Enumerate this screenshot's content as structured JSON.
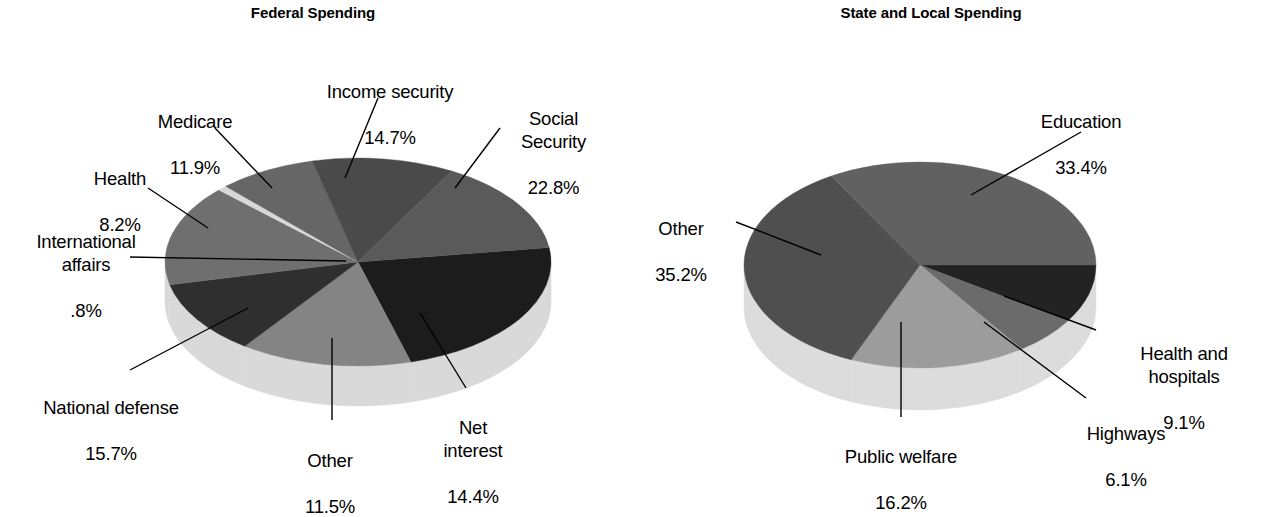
{
  "figure": {
    "background_color": "#ffffff",
    "text_color": "#000000"
  },
  "panels": [
    {
      "id": "federal",
      "title": "Federal Spending"
    },
    {
      "id": "state",
      "title": "State and Local Spending"
    }
  ],
  "federal": {
    "title": "Federal Spending",
    "labels": {
      "income_security": {
        "name": "Income security",
        "value": "14.7%"
      },
      "social_security": {
        "name": "Social\nSecurity",
        "value": "22.8%"
      },
      "net_interest": {
        "name": "Net\ninterest",
        "value": "14.4%"
      },
      "other": {
        "name": "Other",
        "value": "11.5%"
      },
      "national_defense": {
        "name": "National defense",
        "value": "15.7%"
      },
      "international": {
        "name": "International\naffairs",
        "value": ".8%"
      },
      "health": {
        "name": "Health",
        "value": "8.2%"
      },
      "medicare": {
        "name": "Medicare",
        "value": "11.9%"
      }
    }
  },
  "state": {
    "title": "State and Local Spending",
    "labels": {
      "education": {
        "name": "Education",
        "value": "33.4%"
      },
      "health_hospitals": {
        "name": "Health and\nhospitals",
        "value": "9.1%"
      },
      "highways": {
        "name": "Highways",
        "value": "6.1%"
      },
      "public_welfare": {
        "name": "Public welfare",
        "value": "16.2%"
      },
      "other": {
        "name": "Other",
        "value": "35.2%"
      }
    }
  },
  "chart_data": [
    {
      "type": "pie",
      "title": "Federal Spending",
      "id": "federal",
      "unit": "percent",
      "legend": "none",
      "labels_position": "external-with-leader-lines",
      "three_d": true,
      "start_angle_deg": 0,
      "direction": "clockwise",
      "categories": [
        "Social Security",
        "Net interest",
        "Other",
        "National defense",
        "International affairs",
        "Health",
        "Medicare",
        "Income security"
      ],
      "values": [
        22.8,
        14.4,
        11.5,
        15.7,
        0.8,
        8.2,
        11.9,
        14.7
      ],
      "slice_colors": [
        "#1c1c1c",
        "#848484",
        "#2f2f2f",
        "#6f6f6f",
        "#d8d8d8",
        "#666666",
        "#4a4a4a",
        "#5a5a5a"
      ],
      "side_color": "#d9d9d9",
      "total": 100.0
    },
    {
      "type": "pie",
      "title": "State and Local Spending",
      "id": "state",
      "unit": "percent",
      "legend": "none",
      "labels_position": "external-with-leader-lines",
      "three_d": true,
      "start_angle_deg": 0,
      "direction": "clockwise",
      "categories": [
        "Health and hospitals",
        "Highways",
        "Public welfare",
        "Other",
        "Education"
      ],
      "values": [
        9.1,
        6.1,
        16.2,
        35.2,
        33.4
      ],
      "slice_colors": [
        "#232323",
        "#6b6b6b",
        "#9c9c9c",
        "#4f4f4f",
        "#616161"
      ],
      "side_color": "#dcdcdc",
      "total": 100.0
    }
  ]
}
